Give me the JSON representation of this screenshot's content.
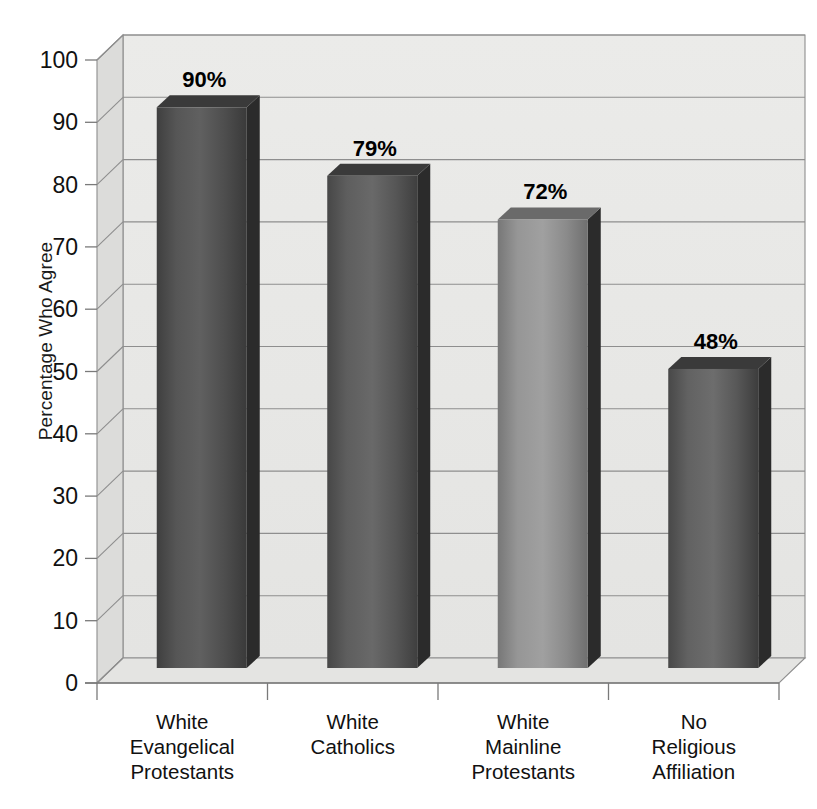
{
  "chart_data": {
    "type": "bar",
    "title": "",
    "subtitle": "",
    "xlabel": "",
    "ylabel": "Percentage Who Agree",
    "categories": [
      "White\nEvangelical\nProtestants",
      "White\nCatholics",
      "White\nMainline\nProtestants",
      "No\nReligious\nAffiliation"
    ],
    "values": [
      90,
      79,
      72,
      48
    ],
    "value_labels": [
      "90%",
      "79%",
      "72%",
      "48%"
    ],
    "ylim": [
      0,
      100
    ],
    "ytick_labels": [
      "0",
      "10",
      "20",
      "30",
      "40",
      "50",
      "60",
      "70",
      "80",
      "90",
      "100"
    ],
    "ytick_values": [
      0,
      10,
      20,
      30,
      40,
      50,
      60,
      70,
      80,
      90,
      100
    ],
    "grid": true,
    "legend": "none",
    "style": "3d-column",
    "bar_colors": [
      "#4d4d4d",
      "#585858",
      "#8a8a8a",
      "#5a5a5a"
    ]
  },
  "colors": {
    "background": "#ffffff",
    "wall": "#e9e9e7",
    "wall_side": "#dcdcda",
    "floor": "#e4e4e2",
    "gridline": "#8e8e8e",
    "axis_line": "#7a7a7a",
    "text": "#111111",
    "bar_dark": "#2b2b2b",
    "bar_mid": "#6e6e6e",
    "bar_light": "#9b9b9b"
  }
}
